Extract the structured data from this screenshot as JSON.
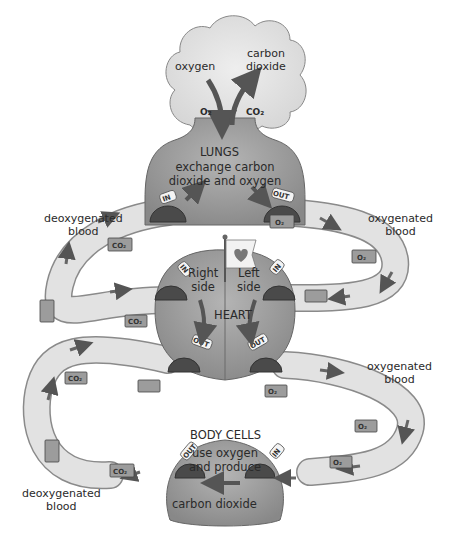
{
  "cloud": {
    "oxygen_label": "oxygen",
    "carbon_label_line1": "carbon",
    "carbon_label_line2": "dioxide",
    "o2_symbol": "O₂",
    "co2_symbol": "CO₂"
  },
  "lungs": {
    "title": "LUNGS",
    "desc_line1": "exchange carbon",
    "desc_line2": "dioxide and oxygen",
    "in_tag": "IN",
    "out_tag": "OUT"
  },
  "heart": {
    "title": "HEART",
    "right_line1": "Right",
    "right_line2": "side",
    "left_line1": "Left",
    "left_line2": "side",
    "in_tag": "IN",
    "out_tag": "OUT",
    "flag_icon": "heart-icon"
  },
  "body_cells": {
    "title": "BODY CELLS",
    "desc_line1": "use oxygen",
    "desc_line2": "and produce",
    "desc_line3": "carbon dioxide",
    "in_tag": "IN",
    "out_tag": "OUT"
  },
  "side_labels": {
    "deoxy_top_line1": "deoxygenated",
    "deoxy_top_line2": "blood",
    "oxy_top_line1": "oxygenated",
    "oxy_top_line2": "blood",
    "oxy_mid_line1": "oxygenated",
    "oxy_mid_line2": "blood",
    "deoxy_bottom_line1": "deoxygenated",
    "deoxy_bottom_line2": "blood"
  },
  "trucks": {
    "co2": "CO₂",
    "o2": "O₂"
  },
  "colors": {
    "organ_fill": "#9a9a9a",
    "road_fill": "#e2e2e2",
    "road_edge": "#8a8a8a",
    "arrow": "#555555",
    "cloud_fill": "#e8e8e8"
  }
}
